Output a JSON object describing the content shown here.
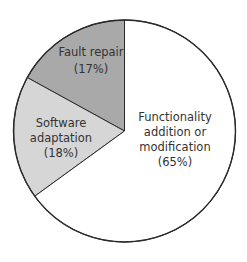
{
  "chart_data": {
    "type": "pie",
    "title": "",
    "start_angle_deg": 90,
    "direction": "counterclockwise",
    "slices": [
      {
        "label": "Fault repair",
        "value": 17,
        "value_label": "(17%)",
        "color": "#a9a9a9"
      },
      {
        "label": "Software adaptation",
        "value": 18,
        "value_label": "(18%)",
        "color": "#d6d6d6"
      },
      {
        "label": "Functionality addition or modification",
        "value": 65,
        "value_label": "(65%)",
        "color": "#ffffff"
      }
    ],
    "categories": [
      "Fault repair",
      "Software adaptation",
      "Functionality addition or modification"
    ],
    "values": [
      17,
      18,
      65
    ],
    "legend": "none (labels inside slices)"
  },
  "labels": {
    "fault": {
      "line1": "Fault repair",
      "line2": "(17%)"
    },
    "software": {
      "line1": "Software",
      "line2": "adaptation",
      "line3": "(18%)"
    },
    "functionality": {
      "line1": "Functionality",
      "line2": "addition or",
      "line3": "modification",
      "line4": "(65%)"
    }
  }
}
